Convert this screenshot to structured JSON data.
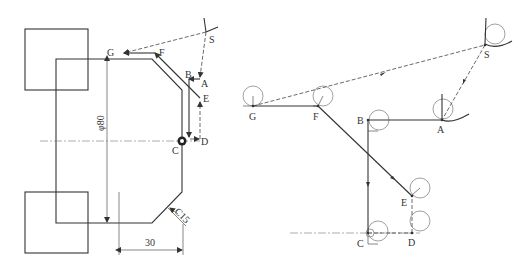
{
  "left_figure": {
    "title": "Workpiece and tool path",
    "labels": {
      "S": "S",
      "A": "A",
      "B": "B",
      "C": "C",
      "D": "D",
      "E": "E",
      "F": "F",
      "G": "G"
    },
    "dimensions": {
      "diameter": "φ80",
      "length": "30",
      "chamfer": "C15"
    }
  },
  "right_figure": {
    "title": "Tool nose path",
    "labels": {
      "S": "S",
      "A": "A",
      "B": "B",
      "C": "C",
      "D": "D",
      "E": "E",
      "F": "F",
      "G": "G"
    }
  }
}
